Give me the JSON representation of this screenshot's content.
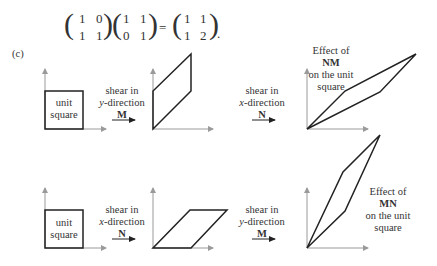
{
  "equation": {
    "matrix_a": [
      [
        "1",
        "0"
      ],
      [
        "1",
        "1"
      ]
    ],
    "matrix_b": [
      [
        "1",
        "1"
      ],
      [
        "0",
        "1"
      ]
    ],
    "equals": "=",
    "matrix_c": [
      [
        "1",
        "1"
      ],
      [
        "1",
        "2"
      ]
    ],
    "period": "."
  },
  "figure": {
    "label": "(c)",
    "rows": [
      {
        "unit_square_label": [
          "unit",
          "square"
        ],
        "first_shear": {
          "line1": "shear in",
          "dir_var": "y",
          "dir_rest": "-direction",
          "matrix": "M"
        },
        "second_shear": {
          "line1": "shear in",
          "dir_var": "x",
          "dir_rest": "-direction",
          "matrix": "N"
        },
        "effect": {
          "line1": "Effect of",
          "matrix": "NM",
          "line3": "on the unit",
          "line4": "square"
        }
      },
      {
        "unit_square_label": [
          "unit",
          "square"
        ],
        "first_shear": {
          "line1": "shear in",
          "dir_var": "x",
          "dir_rest": "-direction",
          "matrix": "N"
        },
        "second_shear": {
          "line1": "shear in",
          "dir_var": "y",
          "dir_rest": "-direction",
          "matrix": "M"
        },
        "effect": {
          "line1": "Effect of",
          "matrix": "MN",
          "line3": "on the unit",
          "line4": "square"
        }
      }
    ]
  },
  "colors": {
    "axis": "#9a9a9a",
    "shape": "#222222",
    "text": "#333333"
  }
}
